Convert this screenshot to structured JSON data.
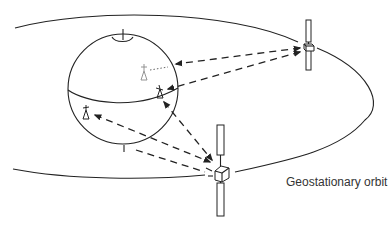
{
  "diagram": {
    "labels": {
      "orbit": "Geostationary orbit"
    },
    "elements": {
      "earth": "Earth globe with equator",
      "satellites": [
        "Satellite A (upper right)",
        "Satellite B (lower center)"
      ],
      "ground_stations": [
        "Ground station (hidden, far side)",
        "Ground station (right, near equator)",
        "Ground station (left, southern hemisphere)"
      ]
    },
    "colors": {
      "stroke": "#222222",
      "background": "#ffffff",
      "text": "#333333"
    }
  }
}
